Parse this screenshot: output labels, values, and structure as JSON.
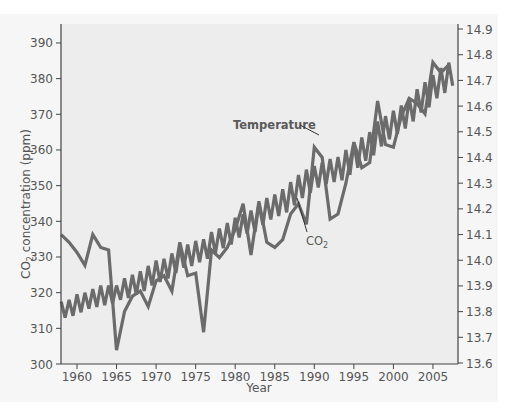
{
  "chart_data": {
    "type": "line",
    "title": "",
    "xlabel": "Year",
    "ylabel": "CO2 concentration (ppm)",
    "ylabel_right": "",
    "xlim": [
      1958,
      2008
    ],
    "ylim": [
      300,
      395
    ],
    "ylim_right": [
      13.6,
      14.9
    ],
    "grid": false,
    "legend": "none (inline annotations)",
    "x_ticks": [
      "1960",
      "1965",
      "1970",
      "1975",
      "1980",
      "1985",
      "1990",
      "1995",
      "2000",
      "2005"
    ],
    "y_ticks_left": [
      "300",
      "310",
      "320",
      "330",
      "340",
      "350",
      "360",
      "370",
      "380",
      "390"
    ],
    "y_ticks_right": [
      "13.6",
      "13.7",
      "13.8",
      "13.9",
      "14.0",
      "14.1",
      "14.2",
      "14.3",
      "14.4",
      "14.5",
      "14.6",
      "14.7",
      "14.8",
      "14.9"
    ],
    "annotations": [
      {
        "text": "Temperature",
        "target_series": "Temperature",
        "at": [
          1990,
          14.47
        ]
      },
      {
        "text": "CO2",
        "target_series": "CO2",
        "at": [
          1986,
          14.05
        ]
      }
    ],
    "series": [
      {
        "name": "Temperature",
        "axis": "right",
        "unit": "°C",
        "x": [
          1958,
          1959,
          1960,
          1961,
          1962,
          1963,
          1964,
          1965,
          1966,
          1967,
          1968,
          1969,
          1970,
          1971,
          1972,
          1973,
          1974,
          1975,
          1976,
          1977,
          1978,
          1979,
          1980,
          1981,
          1982,
          1983,
          1984,
          1985,
          1986,
          1987,
          1988,
          1989,
          1990,
          1991,
          1992,
          1993,
          1994,
          1995,
          1996,
          1997,
          1998,
          1999,
          2000,
          2001,
          2002,
          2003,
          2004,
          2005,
          2006,
          2007
        ],
        "values": [
          14.1,
          14.07,
          14.03,
          13.98,
          14.1,
          14.05,
          14.04,
          13.65,
          13.8,
          13.86,
          13.88,
          13.82,
          13.92,
          13.94,
          13.88,
          14.07,
          13.94,
          13.95,
          13.72,
          14.04,
          14.01,
          14.05,
          14.12,
          14.22,
          14.02,
          14.23,
          14.07,
          14.05,
          14.08,
          14.18,
          14.22,
          14.14,
          14.44,
          14.4,
          14.16,
          14.18,
          14.3,
          14.46,
          14.36,
          14.38,
          14.62,
          14.45,
          14.44,
          14.56,
          14.63,
          14.61,
          14.57,
          14.77,
          14.73,
          14.76
        ]
      },
      {
        "name": "CO2",
        "axis": "left",
        "unit": "ppm",
        "x": [
          1958,
          1958.5,
          1959,
          1959.5,
          1960,
          1960.5,
          1961,
          1961.5,
          1962,
          1962.5,
          1963,
          1963.5,
          1964,
          1964.5,
          1965,
          1965.5,
          1966,
          1966.5,
          1967,
          1967.5,
          1968,
          1968.5,
          1969,
          1969.5,
          1970,
          1970.5,
          1971,
          1971.5,
          1972,
          1972.5,
          1973,
          1973.5,
          1974,
          1974.5,
          1975,
          1975.5,
          1976,
          1976.5,
          1977,
          1977.5,
          1978,
          1978.5,
          1979,
          1979.5,
          1980,
          1980.5,
          1981,
          1981.5,
          1982,
          1982.5,
          1983,
          1983.5,
          1984,
          1984.5,
          1985,
          1985.5,
          1986,
          1986.5,
          1987,
          1987.5,
          1988,
          1988.5,
          1989,
          1989.5,
          1990,
          1990.5,
          1991,
          1991.5,
          1992,
          1992.5,
          1993,
          1993.5,
          1994,
          1994.5,
          1995,
          1995.5,
          1996,
          1996.5,
          1997,
          1997.5,
          1998,
          1998.5,
          1999,
          1999.5,
          2000,
          2000.5,
          2001,
          2001.5,
          2002,
          2002.5,
          2003,
          2003.5,
          2004,
          2004.5,
          2005,
          2005.5,
          2006,
          2006.5,
          2007,
          2007.5
        ],
        "values": [
          317.5,
          313.0,
          318.0,
          313.5,
          319.5,
          314.5,
          320.0,
          315.5,
          321.0,
          316.0,
          322.0,
          316.5,
          322.0,
          317.0,
          322.0,
          318.0,
          324.0,
          318.5,
          325.0,
          319.5,
          326.0,
          320.5,
          327.5,
          322.0,
          329.0,
          323.0,
          329.5,
          324.0,
          331.0,
          325.5,
          333.0,
          327.0,
          333.5,
          327.5,
          334.5,
          328.5,
          335.0,
          329.5,
          337.0,
          331.0,
          338.0,
          332.5,
          339.5,
          333.5,
          341.0,
          335.5,
          342.0,
          336.5,
          343.0,
          337.0,
          345.0,
          339.0,
          346.5,
          340.5,
          347.5,
          341.5,
          349.0,
          342.5,
          351.0,
          344.5,
          353.0,
          346.5,
          354.5,
          348.0,
          355.5,
          349.5,
          356.5,
          350.5,
          357.5,
          351.0,
          358.0,
          351.5,
          360.0,
          353.0,
          362.0,
          355.0,
          363.5,
          357.0,
          365.0,
          358.5,
          368.0,
          361.0,
          369.5,
          363.0,
          371.0,
          364.5,
          372.5,
          366.0,
          374.5,
          368.0,
          377.0,
          370.5,
          379.0,
          372.0,
          381.0,
          374.5,
          383.0,
          376.0,
          384.5,
          378.0
        ]
      }
    ]
  },
  "axes": {
    "x_title": "Year",
    "y_left_title_prefix": "CO",
    "y_left_title_sub": "2",
    "y_left_title_suffix": " concentration (ppm)"
  },
  "annotations": {
    "temperature_label": "Temperature",
    "co2_label_prefix": "CO",
    "co2_label_sub": "2"
  },
  "colors": {
    "line": "#6b6b6b",
    "axis": "#444444",
    "plot_bg": "#ededed",
    "frame_bg": "#f6f6f6",
    "text": "#555555"
  }
}
